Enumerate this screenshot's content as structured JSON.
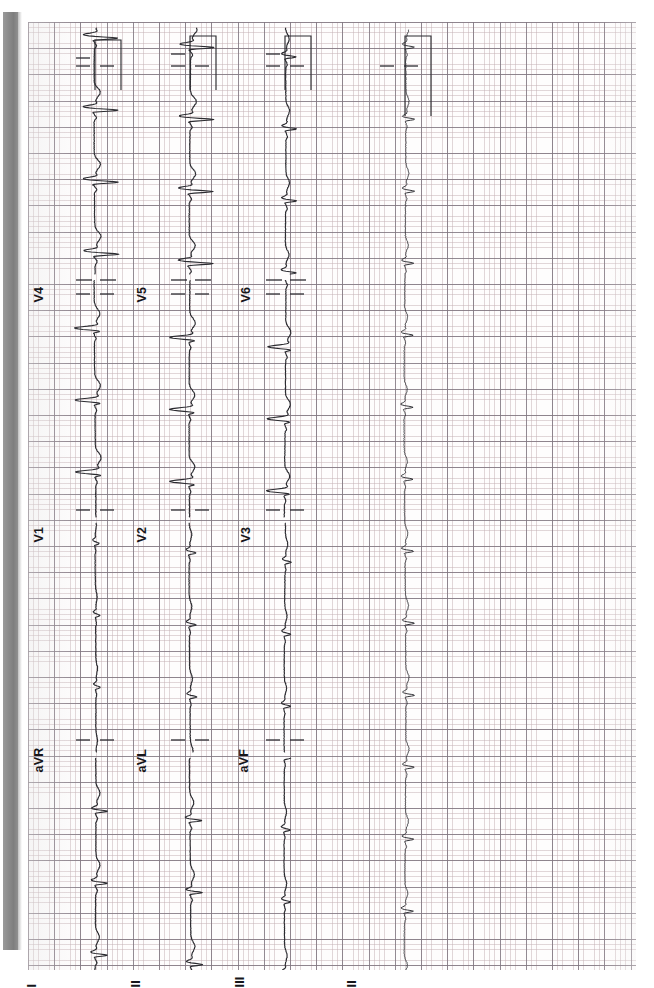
{
  "document": {
    "kind": "12-lead electrocardiogram strip chart (scanned, rotated 90°)",
    "paper": {
      "bg_color": "#fefdfd",
      "minor_grid_color": "#c4b0b4",
      "major_grid_color": "#807680",
      "trace_color": "#2b2b30",
      "scanner_edge_color": "#8e8e8e"
    }
  },
  "leads": {
    "row1": [
      {
        "name": "I",
        "label": "I"
      },
      {
        "name": "aVR",
        "label": "aVR"
      },
      {
        "name": "V1",
        "label": "V1"
      },
      {
        "name": "V4",
        "label": "V4"
      }
    ],
    "row2": [
      {
        "name": "II",
        "label": "II"
      },
      {
        "name": "aVL",
        "label": "aVL"
      },
      {
        "name": "V2",
        "label": "V2"
      },
      {
        "name": "V5",
        "label": "V5"
      }
    ],
    "row3": [
      {
        "name": "III",
        "label": "III"
      },
      {
        "name": "aVF",
        "label": "aVF"
      },
      {
        "name": "V3",
        "label": "V3"
      },
      {
        "name": "V6",
        "label": "V6"
      }
    ],
    "rhythm": [
      {
        "name": "II-rhythm",
        "label": "II"
      }
    ]
  },
  "chart_data": {
    "type": "line",
    "xlabel": "",
    "ylabel": "",
    "orientation": "rotated-90-ccw",
    "grid": true,
    "grid_minor_px": 5.24,
    "grid_major_px": 26.2,
    "series": [
      {
        "name": "I",
        "channel": "limb",
        "calibration_pulse": true
      },
      {
        "name": "aVR",
        "channel": "augmented",
        "calibration_pulse": false
      },
      {
        "name": "V1",
        "channel": "precordial",
        "calibration_pulse": false
      },
      {
        "name": "V4",
        "channel": "precordial",
        "calibration_pulse": true
      },
      {
        "name": "II",
        "channel": "limb",
        "calibration_pulse": true
      },
      {
        "name": "aVL",
        "channel": "augmented",
        "calibration_pulse": false
      },
      {
        "name": "V2",
        "channel": "precordial",
        "calibration_pulse": false
      },
      {
        "name": "V5",
        "channel": "precordial",
        "calibration_pulse": true
      },
      {
        "name": "III",
        "channel": "limb",
        "calibration_pulse": true
      },
      {
        "name": "aVF",
        "channel": "augmented",
        "calibration_pulse": false
      },
      {
        "name": "V3",
        "channel": "precordial",
        "calibration_pulse": false
      },
      {
        "name": "V6",
        "channel": "precordial",
        "calibration_pulse": true
      },
      {
        "name": "II (rhythm strip)",
        "channel": "rhythm",
        "calibration_pulse": true
      }
    ],
    "column_baselines_px": [
      95,
      190,
      285,
      405
    ],
    "legend_position": "inline-left-of-each-trace"
  },
  "label_positions": {
    "V4": {
      "x": 45,
      "y": 265
    },
    "V5": {
      "x": 148,
      "y": 265
    },
    "V6": {
      "x": 252,
      "y": 265
    },
    "V1": {
      "x": 58,
      "y": 510
    },
    "V2": {
      "x": 160,
      "y": 510
    },
    "V3": {
      "x": 252,
      "y": 510
    },
    "aVR": {
      "x": 45,
      "y": 735
    },
    "aVL": {
      "x": 148,
      "y": 735
    },
    "aVF": {
      "x": 248,
      "y": 735
    },
    "I": {
      "x": 38,
      "y": 972
    },
    "II": {
      "x": 142,
      "y": 972
    },
    "III": {
      "x": 246,
      "y": 972
    },
    "IIr": {
      "x": 358,
      "y": 972
    }
  }
}
